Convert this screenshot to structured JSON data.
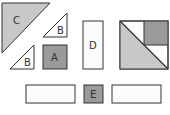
{
  "diagram": {
    "title": "",
    "colors": {
      "dark": "#9a9a9a",
      "light": "#c8c8c8",
      "white": "#fcfcfc",
      "stroke": "#333333"
    },
    "pieces": [
      {
        "id": "C",
        "label": "C",
        "shape": "right-triangle",
        "fill": "light"
      },
      {
        "id": "B1",
        "label": "B",
        "shape": "right-triangle",
        "fill": "white"
      },
      {
        "id": "B2",
        "label": "B",
        "shape": "right-triangle",
        "fill": "white"
      },
      {
        "id": "A",
        "label": "A",
        "shape": "square",
        "fill": "dark"
      },
      {
        "id": "D",
        "label": "D",
        "shape": "rectangle",
        "fill": "white"
      },
      {
        "id": "composite",
        "label": "",
        "shape": "square-composite",
        "fill": "mixed"
      },
      {
        "id": "rect-left",
        "label": "",
        "shape": "rectangle",
        "fill": "white"
      },
      {
        "id": "E",
        "label": "E",
        "shape": "square",
        "fill": "dark"
      },
      {
        "id": "rect-right",
        "label": "",
        "shape": "rectangle",
        "fill": "white"
      }
    ]
  }
}
